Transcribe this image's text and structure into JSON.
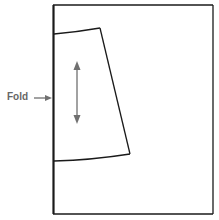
{
  "diagram": {
    "labels": {
      "fold": "Fold"
    },
    "colors": {
      "outline": "#1a1a1a",
      "arrow": "#707070",
      "label": "#666666",
      "background": "#ffffff"
    },
    "icons": {
      "fold_pointer": "arrow-right-icon",
      "grainline": "double-headed-vertical-arrow-icon"
    }
  }
}
